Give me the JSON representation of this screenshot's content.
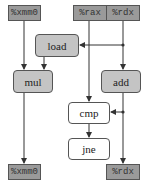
{
  "inputs": {
    "xmm0": "%xmm0",
    "rax": "%rax",
    "rdx": "%rdx"
  },
  "ops": {
    "load": "load",
    "mul": "mul",
    "add": "add",
    "cmp": "cmp",
    "jne": "jne"
  },
  "outputs": {
    "xmm0": "%xmm0",
    "rdx": "%rdx"
  },
  "colors": {
    "register_fill": "#9a9a9a",
    "op_grey_fill": "#c4c4c4",
    "op_white_fill": "#ffffff",
    "line": "#333333"
  }
}
